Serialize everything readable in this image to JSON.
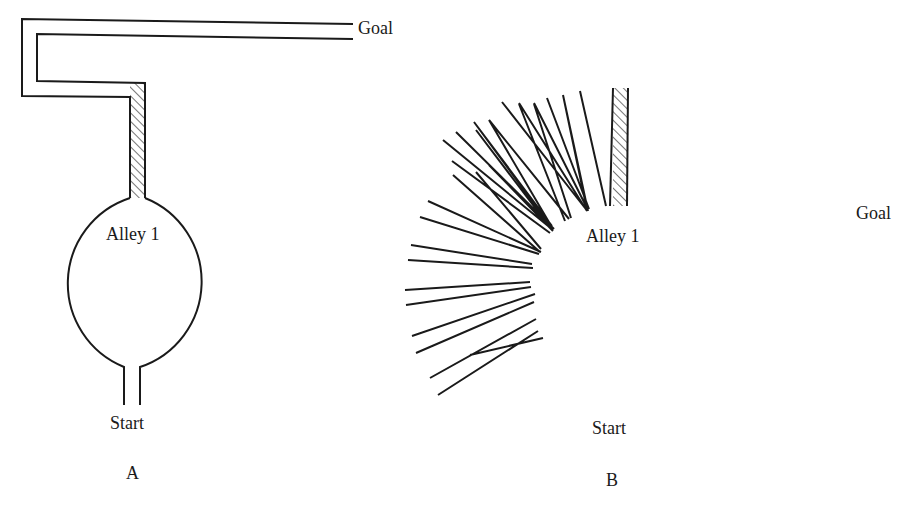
{
  "diagram_a": {
    "goal_label": "Goal",
    "center_label": "Alley 1",
    "start_label": "Start",
    "panel_label": "A"
  },
  "diagram_b": {
    "goal_label": "Goal",
    "center_label": "Alley 1",
    "start_label": "Start",
    "panel_label": "B"
  },
  "colors": {
    "line": "#1a1a1a",
    "background": "#ffffff"
  }
}
